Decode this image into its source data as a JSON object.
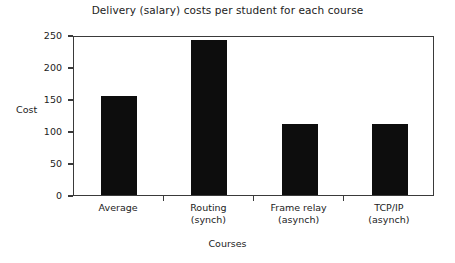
{
  "chart_data": {
    "type": "bar",
    "title": "Delivery (salary) costs per student for each course",
    "xlabel": "Courses",
    "ylabel": "Cost",
    "categories": [
      "Average",
      "Routing (synch)",
      "Frame relay (asynch)",
      "TCP/IP (asynch)"
    ],
    "category_lines": [
      {
        "line1": "Average",
        "line2": ""
      },
      {
        "line1": "Routing",
        "line2": "(synch)"
      },
      {
        "line1": "Frame relay",
        "line2": "(asynch)"
      },
      {
        "line1": "TCP/IP",
        "line2": "(asynch)"
      }
    ],
    "values": [
      155,
      242,
      111,
      111
    ],
    "ylim": [
      0,
      250
    ],
    "yticks": [
      0,
      50,
      100,
      150,
      200,
      250
    ],
    "ytick_labels": [
      "0",
      "50",
      "100",
      "150",
      "200",
      "250"
    ],
    "grid": false,
    "legend": null,
    "bar_color": "#0d0d0d",
    "axis_color": "#3a3a3a",
    "background_color": "#ffffff"
  }
}
